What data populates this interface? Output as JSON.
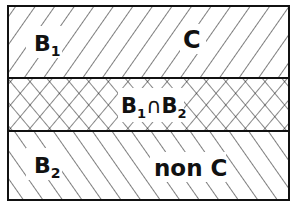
{
  "diagram": {
    "regions": [
      {
        "id": "top",
        "hatch": "forward-diagonal",
        "labels": {
          "left": {
            "main": "B",
            "sub": "1"
          },
          "right": "C"
        }
      },
      {
        "id": "middle",
        "hatch": "cross",
        "label": {
          "a": "B",
          "a_sub": "1",
          "op": "∩",
          "b": "B",
          "b_sub": "2"
        }
      },
      {
        "id": "bottom",
        "hatch": "back-diagonal",
        "labels": {
          "left": {
            "main": "B",
            "sub": "2"
          },
          "right": "non C"
        }
      }
    ],
    "colors": {
      "line": "#111111",
      "background": "#ffffff"
    }
  }
}
